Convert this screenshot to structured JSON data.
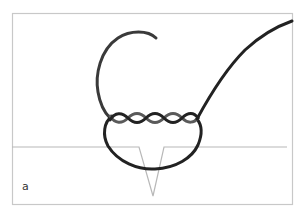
{
  "figure": {
    "panel_label": "a",
    "colors": {
      "frame": "#c8c8c8",
      "tissue_line": "#b8b8b8",
      "thread_dark": "#222222",
      "thread_light": "#5a5a5a",
      "background": "#ffffff"
    },
    "elements": [
      {
        "name": "frame",
        "shape": "rectangle"
      },
      {
        "name": "tissue-surface-line",
        "shape": "horizontal line with V notch"
      },
      {
        "name": "suture-loop-upper",
        "shape": "C-shaped arc"
      },
      {
        "name": "suture-twisted-section",
        "shape": "two intertwined strands",
        "twists": 4
      },
      {
        "name": "suture-loop-lower",
        "shape": "U-shaped loop through tissue"
      },
      {
        "name": "suture-tail",
        "shape": "long curved strand to top-right"
      }
    ]
  }
}
